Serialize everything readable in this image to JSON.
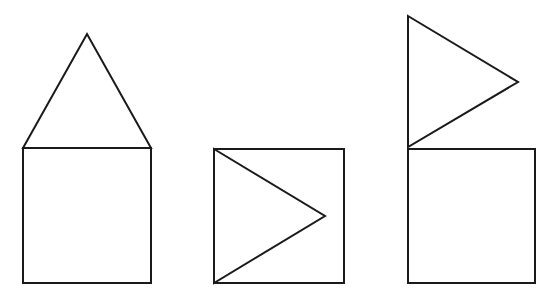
{
  "canvas": {
    "width": 556,
    "height": 292,
    "background": "#ffffff",
    "stroke": "#1a1a1a"
  },
  "figures": [
    {
      "name": "figure-1-triangle-on-top",
      "square": {
        "x": 23,
        "y": 148,
        "w": 128,
        "h": 135
      },
      "triangle": [
        [
          23,
          148
        ],
        [
          87,
          34
        ],
        [
          151,
          148
        ]
      ]
    },
    {
      "name": "figure-2-triangle-inside",
      "square": {
        "x": 214,
        "y": 149,
        "w": 130,
        "h": 134
      },
      "triangle": [
        [
          214,
          149
        ],
        [
          325,
          216
        ],
        [
          214,
          283
        ]
      ]
    },
    {
      "name": "figure-3-triangle-flag-on-top",
      "square": {
        "x": 408,
        "y": 149,
        "w": 127,
        "h": 134
      },
      "triangle": [
        [
          408,
          16
        ],
        [
          518,
          82
        ],
        [
          408,
          147
        ]
      ]
    }
  ]
}
